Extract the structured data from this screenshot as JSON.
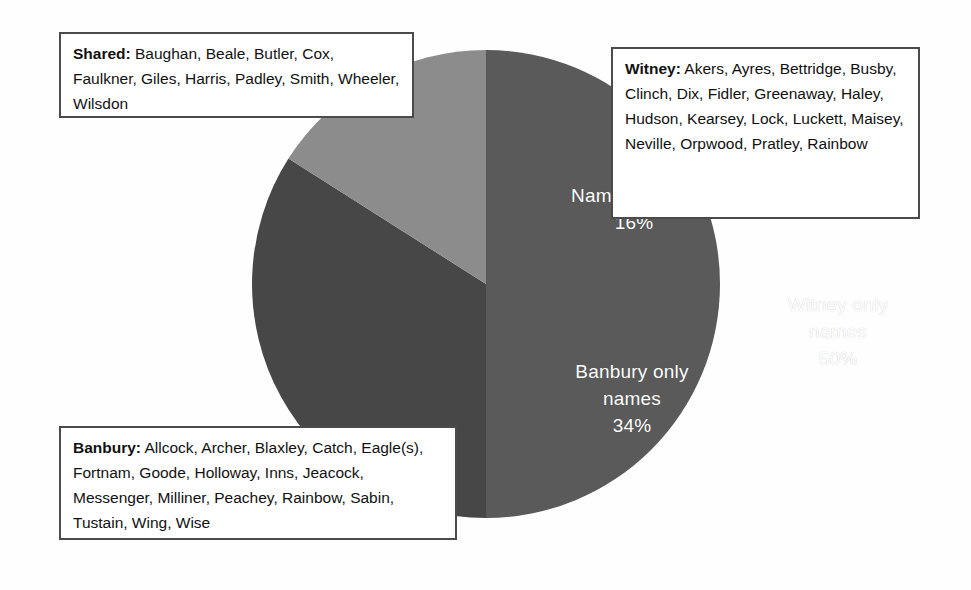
{
  "figure": {
    "background_color": "#fefefe",
    "pie": {
      "center_x": 238,
      "center_y": 234,
      "radius": 234
    }
  },
  "chart_data": {
    "type": "pie",
    "title": "",
    "subtitle": "",
    "xlabel": "",
    "ylabel": "",
    "legend_position": "none",
    "grid": false,
    "categories": [
      "Witney only names",
      "Banbury only names",
      "Names shared"
    ],
    "values": [
      50,
      34,
      16
    ],
    "units": "%",
    "colors": [
      "#5a5a5a",
      "#474747",
      "#8c8c8c"
    ],
    "start_angle_deg": 0,
    "direction": "clockwise",
    "slices": [
      {
        "label": "Witney only names",
        "percent": 50,
        "percent_text": "50%",
        "color": "#5a5a5a",
        "label_line_1": "Witney only",
        "label_line_2": "names",
        "label_line_3": "50%"
      },
      {
        "label": "Banbury only names",
        "percent": 34,
        "percent_text": "34%",
        "color": "#474747",
        "label_line_1": "Banbury only",
        "label_line_2": "names",
        "label_line_3": "34%"
      },
      {
        "label": "Names shared",
        "percent": 16,
        "percent_text": "16%",
        "color": "#8c8c8c",
        "label_line_1": "Names shared",
        "label_line_2": "",
        "label_line_3": "16%"
      }
    ],
    "annotations": [
      {
        "id": "shared",
        "title": "Shared:",
        "names": "Baughan, Beale, Butler, Cox, Faulkner, Giles, Harris, Padley, Smith, Wheeler, Wilsdon"
      },
      {
        "id": "witney",
        "title": "Witney:",
        "names": "Akers, Ayres, Bettridge, Busby, Clinch, Dix, Fidler, Greenaway, Haley, Hudson, Kearsey, Lock, Luckett, Maisey, Neville, Orpwood, Pratley, Rainbow"
      },
      {
        "id": "banbury",
        "title": "Banbury:",
        "names": "Allcock, Archer, Blaxley, Catch, Eagle(s), Fortnam, Goode, Holloway, Inns, Jeacock, Messenger, Milliner, Peachey, Rainbow, Sabin, Tustain, Wing, Wise"
      }
    ]
  },
  "callouts": {
    "shared": {
      "label": "Shared:",
      "text": " Baughan, Beale, Butler, Cox, Faulkner, Giles, Harris, Padley, Smith, Wheeler, Wilsdon"
    },
    "witney": {
      "label": "Witney:",
      "text": " Akers, Ayres, Bettridge, Busby, Clinch, Dix, Fidler, Greenaway, Haley, Hudson, Kearsey, Lock, Luckett, Maisey, Neville, Orpwood, Pratley, Rainbow"
    },
    "banbury": {
      "label": "Banbury:",
      "text": " Allcock, Archer, Blaxley, Catch, Eagle(s), Fortnam, Goode, Holloway, Inns, Jeacock, Messenger, Milliner, Peachey, Rainbow, Sabin, Tustain, Wing, Wise"
    }
  },
  "slice_labels": {
    "shared": {
      "name": "Names shared",
      "percent": "16%"
    },
    "witney": {
      "name_line1": "Witney only",
      "name_line2": "names",
      "percent": "50%"
    },
    "banbury": {
      "name_line1": "Banbury only",
      "name_line2": "names",
      "percent": "34%"
    }
  }
}
